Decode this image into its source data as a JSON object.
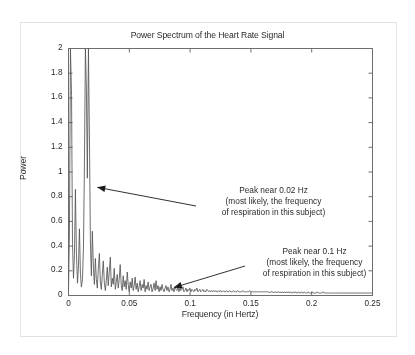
{
  "figure": {
    "title": "Power Spectrum of the Heart Rate Signal",
    "border_color": "#e2e2e2",
    "background": "#ffffff"
  },
  "chart_data": {
    "type": "line",
    "title": "Power Spectrum of the Heart Rate Signal",
    "xlabel": "Frequency (in Hertz)",
    "ylabel": "Power",
    "xlim": [
      0,
      0.25
    ],
    "ylim": [
      0,
      2
    ],
    "xticks": [
      "0",
      "0.05",
      "0.1",
      "0.15",
      "0.2",
      "0.25"
    ],
    "xtick_values": [
      0,
      0.05,
      0.1,
      0.15,
      0.2,
      0.25
    ],
    "yticks": [
      "0",
      "0.2",
      "0.4",
      "0.6",
      "0.8",
      "1",
      "1.2",
      "1.4",
      "1.6",
      "1.8",
      "2"
    ],
    "ytick_values": [
      0,
      0.2,
      0.4,
      0.6,
      0.8,
      1,
      1.2,
      1.4,
      1.6,
      1.8,
      2
    ],
    "grid": false,
    "legend": false,
    "line_color": "#555555",
    "series": [
      {
        "name": "Power spectral density",
        "x": [
          0.0,
          0.0008,
          0.0016,
          0.0025,
          0.0033,
          0.0041,
          0.0049,
          0.0057,
          0.0065,
          0.0074,
          0.0082,
          0.009,
          0.0098,
          0.0106,
          0.0115,
          0.0123,
          0.0131,
          0.0139,
          0.0147,
          0.0155,
          0.0164,
          0.0172,
          0.018,
          0.0188,
          0.0196,
          0.0205,
          0.0213,
          0.0221,
          0.0229,
          0.0237,
          0.0245,
          0.0254,
          0.0262,
          0.027,
          0.0278,
          0.0286,
          0.0295,
          0.0303,
          0.0311,
          0.0319,
          0.0327,
          0.0335,
          0.0344,
          0.0352,
          0.036,
          0.0368,
          0.0376,
          0.0385,
          0.0393,
          0.0401,
          0.0409,
          0.0417,
          0.0425,
          0.0434,
          0.0442,
          0.045,
          0.0458,
          0.0466,
          0.0475,
          0.0483,
          0.0491,
          0.0499,
          0.0507,
          0.0516,
          0.0524,
          0.0532,
          0.054,
          0.0548,
          0.0556,
          0.0565,
          0.0573,
          0.0581,
          0.0589,
          0.0597,
          0.0606,
          0.0614,
          0.0622,
          0.063,
          0.0638,
          0.0646,
          0.0655,
          0.0663,
          0.0671,
          0.0679,
          0.0687,
          0.0696,
          0.0704,
          0.0712,
          0.072,
          0.0728,
          0.0736,
          0.0745,
          0.0753,
          0.0761,
          0.0769,
          0.0777,
          0.0786,
          0.0794,
          0.0802,
          0.081,
          0.0818,
          0.0827,
          0.0835,
          0.0843,
          0.0851,
          0.0859,
          0.0867,
          0.0876,
          0.0884,
          0.0892,
          0.09,
          0.0908,
          0.0917,
          0.0925,
          0.0933,
          0.0941,
          0.0949,
          0.0957,
          0.0966,
          0.0974,
          0.0982,
          0.099,
          0.0998,
          0.1007,
          0.1015,
          0.1023,
          0.1031,
          0.1039,
          0.1047,
          0.1056,
          0.1064,
          0.1072,
          0.108,
          0.1088,
          0.1097,
          0.1105,
          0.1113,
          0.1121,
          0.1129,
          0.1138,
          0.1146,
          0.1154,
          0.1162,
          0.117,
          0.1178,
          0.1187,
          0.1195,
          0.1203,
          0.1211,
          0.1219,
          0.1228,
          0.1236,
          0.1244,
          0.1252,
          0.126,
          0.1268,
          0.1277,
          0.1285,
          0.1293,
          0.1301,
          0.1309,
          0.1318,
          0.1326,
          0.1334,
          0.1342,
          0.135,
          0.1358,
          0.1367,
          0.1375,
          0.1383,
          0.1391,
          0.1399,
          0.1408,
          0.1416,
          0.1424,
          0.1432,
          0.144,
          0.1449,
          0.1457,
          0.1465,
          0.1473,
          0.1481,
          0.1489,
          0.1498,
          0.1506,
          0.1514,
          0.1522,
          0.153,
          0.1539,
          0.1547,
          0.1555,
          0.1563,
          0.1571,
          0.1579,
          0.1588,
          0.1596,
          0.1604,
          0.1612,
          0.162,
          0.1629,
          0.1637,
          0.1645,
          0.1653,
          0.1661,
          0.1669,
          0.1678,
          0.1686,
          0.1694,
          0.1702,
          0.171,
          0.1719,
          0.1727,
          0.1735,
          0.1743,
          0.1751,
          0.176,
          0.1768,
          0.1776,
          0.1784,
          0.1792,
          0.18,
          0.1809,
          0.1817,
          0.1825,
          0.1833,
          0.1841,
          0.185,
          0.1858,
          0.1866,
          0.1874,
          0.1882,
          0.189,
          0.1899,
          0.1907,
          0.1915,
          0.1923,
          0.1931,
          0.194,
          0.1948,
          0.1956,
          0.1964,
          0.1972,
          0.198,
          0.1989,
          0.1997,
          0.2005,
          0.2013,
          0.2021,
          0.203,
          0.2038,
          0.2046,
          0.2054,
          0.2062,
          0.2071,
          0.2079,
          0.2087,
          0.2095,
          0.2103,
          0.2111,
          0.212,
          0.2128,
          0.2136,
          0.2144,
          0.2152,
          0.2161,
          0.2169,
          0.2177,
          0.2185,
          0.2193,
          0.2201,
          0.221,
          0.2218,
          0.2226,
          0.2234,
          0.2242,
          0.2251,
          0.2259,
          0.2267,
          0.2275,
          0.2283,
          0.2291,
          0.23,
          0.2308,
          0.2316,
          0.2324,
          0.2332,
          0.2341,
          0.2349,
          0.2357,
          0.2365,
          0.2373,
          0.2382,
          0.239,
          0.2398,
          0.2406,
          0.2414,
          0.2422,
          0.2431,
          0.2439,
          0.2447,
          0.2455,
          0.2463,
          0.2472,
          0.248,
          0.2488,
          0.2496,
          0.25
        ],
        "y": [
          0.04,
          0.55,
          2.0,
          1.62,
          0.42,
          0.14,
          0.33,
          0.86,
          0.35,
          0.1,
          0.24,
          0.54,
          0.18,
          0.07,
          0.13,
          0.4,
          1.05,
          2.0,
          1.68,
          0.95,
          2.0,
          1.3,
          0.45,
          0.16,
          0.52,
          0.22,
          0.09,
          0.3,
          0.13,
          0.06,
          0.21,
          0.34,
          0.11,
          0.05,
          0.17,
          0.28,
          0.1,
          0.04,
          0.12,
          0.23,
          0.08,
          0.19,
          0.31,
          0.07,
          0.14,
          0.09,
          0.22,
          0.05,
          0.11,
          0.17,
          0.06,
          0.13,
          0.25,
          0.08,
          0.04,
          0.16,
          0.07,
          0.12,
          0.05,
          0.19,
          0.09,
          0.03,
          0.11,
          0.06,
          0.14,
          0.04,
          0.08,
          0.15,
          0.05,
          0.1,
          0.03,
          0.07,
          0.12,
          0.04,
          0.09,
          0.06,
          0.13,
          0.03,
          0.08,
          0.05,
          0.11,
          0.04,
          0.07,
          0.09,
          0.03,
          0.06,
          0.1,
          0.04,
          0.12,
          0.05,
          0.08,
          0.03,
          0.07,
          0.04,
          0.09,
          0.05,
          0.03,
          0.06,
          0.08,
          0.04,
          0.07,
          0.03,
          0.05,
          0.09,
          0.04,
          0.06,
          0.03,
          0.07,
          0.05,
          0.04,
          0.08,
          0.03,
          0.06,
          0.04,
          0.05,
          0.07,
          0.03,
          0.04,
          0.06,
          0.03,
          0.05,
          0.04,
          0.06,
          0.03,
          0.05,
          0.04,
          0.03,
          0.05,
          0.04,
          0.06,
          0.03,
          0.04,
          0.05,
          0.03,
          0.04,
          0.05,
          0.03,
          0.04,
          0.03,
          0.05,
          0.04,
          0.03,
          0.04,
          0.03,
          0.04,
          0.03,
          0.04,
          0.03,
          0.04,
          0.03,
          0.03,
          0.04,
          0.03,
          0.04,
          0.03,
          0.03,
          0.04,
          0.03,
          0.03,
          0.04,
          0.03,
          0.03,
          0.04,
          0.03,
          0.03,
          0.03,
          0.04,
          0.03,
          0.03,
          0.03,
          0.04,
          0.03,
          0.03,
          0.03,
          0.03,
          0.04,
          0.03,
          0.03,
          0.03,
          0.03,
          0.03,
          0.03,
          0.04,
          0.03,
          0.03,
          0.03,
          0.03,
          0.03,
          0.03,
          0.03,
          0.03,
          0.03,
          0.03,
          0.03,
          0.03,
          0.03,
          0.03,
          0.03,
          0.03,
          0.03,
          0.03,
          0.03,
          0.02,
          0.03,
          0.03,
          0.03,
          0.02,
          0.03,
          0.03,
          0.02,
          0.03,
          0.03,
          0.02,
          0.03,
          0.02,
          0.03,
          0.02,
          0.03,
          0.02,
          0.03,
          0.02,
          0.03,
          0.02,
          0.03,
          0.02,
          0.02,
          0.03,
          0.02,
          0.03,
          0.02,
          0.02,
          0.03,
          0.02,
          0.02,
          0.03,
          0.02,
          0.02,
          0.03,
          0.02,
          0.02,
          0.02,
          0.03,
          0.02,
          0.02,
          0.02,
          0.03,
          0.02,
          0.02,
          0.02,
          0.02,
          0.03,
          0.02,
          0.02,
          0.02,
          0.02,
          0.02,
          0.03,
          0.02,
          0.02,
          0.02,
          0.02,
          0.02,
          0.02,
          0.02,
          0.02,
          0.02,
          0.02,
          0.02,
          0.02,
          0.02,
          0.02,
          0.02,
          0.02,
          0.02,
          0.02,
          0.02,
          0.02,
          0.02,
          0.02,
          0.02,
          0.02,
          0.02,
          0.02,
          0.02,
          0.02,
          0.02,
          0.02,
          0.02,
          0.02,
          0.02,
          0.02,
          0.02,
          0.02,
          0.02,
          0.02,
          0.02,
          0.02,
          0.02,
          0.02,
          0.02,
          0.02,
          0.02,
          0.02,
          0.02,
          0.02,
          0.02,
          0.02
        ]
      }
    ],
    "annotations": [
      {
        "id": "respiration",
        "lines": [
          "Peak near 0.02 Hz",
          "(most likely, the frequency",
          "of respiration in this subject)"
        ],
        "text": "Peak near 0.02 Hz (most likely, the frequency of respiration in this subject)",
        "points_to": {
          "x": 0.022,
          "y": 0.86
        }
      },
      {
        "id": "lowfreq",
        "lines": [
          "Peak near 0.1 Hz",
          "(most likely, the frequency",
          "of respiration in this subject)"
        ],
        "text": "Peak near 0.1 Hz (most likely, the frequency of respiration in this subject)",
        "points_to": {
          "x": 0.085,
          "y": 0.04
        }
      }
    ]
  }
}
